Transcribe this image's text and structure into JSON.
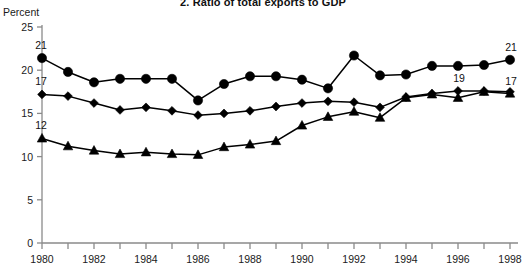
{
  "chart_data": {
    "type": "line",
    "title": "2. Ratio of total exports to GDP",
    "xlabel": "",
    "ylabel": "Percent",
    "ylim": [
      0,
      25
    ],
    "yticks": [
      0,
      5,
      10,
      15,
      20,
      25
    ],
    "ytick_labels": [
      "0",
      "5",
      "10",
      "15",
      "20",
      "25"
    ],
    "xlim": [
      1980,
      1998
    ],
    "x": [
      1980,
      1981,
      1982,
      1983,
      1984,
      1985,
      1986,
      1987,
      1988,
      1989,
      1990,
      1991,
      1992,
      1993,
      1994,
      1995,
      1996,
      1997,
      1998
    ],
    "xticks": [
      1980,
      1981,
      1982,
      1983,
      1984,
      1985,
      1986,
      1987,
      1988,
      1989,
      1990,
      1991,
      1992,
      1993,
      1994,
      1995,
      1996,
      1997,
      1998
    ],
    "xtick_labels": [
      "1980",
      "",
      "1982",
      "",
      "1984",
      "",
      "1986",
      "",
      "1988",
      "",
      "1990",
      "",
      "1992",
      "",
      "1994",
      "",
      "1996",
      "",
      "1998"
    ],
    "grid": false,
    "legend": "none",
    "series": [
      {
        "name": "circle-series",
        "marker": "circle",
        "color": "#000000",
        "start_label": "21",
        "end_label": "21",
        "values": [
          21.4,
          19.8,
          18.6,
          19.0,
          19.0,
          19.0,
          16.5,
          18.4,
          19.3,
          19.3,
          18.9,
          17.9,
          21.7,
          19.4,
          19.5,
          20.5,
          20.5,
          20.6,
          21.2
        ]
      },
      {
        "name": "diamond-series",
        "marker": "diamond",
        "color": "#000000",
        "start_label": "17",
        "end_label": "19",
        "end_label_year": 1996,
        "values": [
          17.2,
          17.0,
          16.2,
          15.4,
          15.7,
          15.3,
          14.8,
          15.0,
          15.3,
          15.8,
          16.2,
          16.4,
          16.3,
          15.7,
          16.9,
          17.3,
          17.6,
          17.6,
          17.5
        ]
      },
      {
        "name": "triangle-series",
        "marker": "triangle",
        "color": "#000000",
        "start_label": "12",
        "end_label": "17",
        "values": [
          12.1,
          11.2,
          10.7,
          10.3,
          10.5,
          10.3,
          10.2,
          11.1,
          11.4,
          11.8,
          13.6,
          14.6,
          15.2,
          14.5,
          16.8,
          17.2,
          16.8,
          17.5,
          17.3
        ]
      }
    ]
  }
}
